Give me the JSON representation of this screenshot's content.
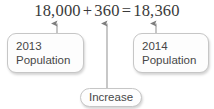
{
  "diagram": {
    "type": "labeled-equation-callout",
    "equation": {
      "left_term": "18,000",
      "plus_sign": "+",
      "middle_term": "360",
      "equals_sign": "=",
      "right_term": "18,360",
      "full_text": "18,000 + 360 = 18,360"
    },
    "callouts": [
      {
        "id": "left",
        "line1": "2013",
        "line2": "Population",
        "points_to": "left_term"
      },
      {
        "id": "middle",
        "line1": "Increase",
        "line2": "",
        "points_to": "middle_term"
      },
      {
        "id": "right",
        "line1": "2014",
        "line2": "Population",
        "points_to": "right_term"
      }
    ],
    "arrows": [
      {
        "id": "arrow-left",
        "name": "up-arrow-icon",
        "x": 57
      },
      {
        "id": "arrow-middle",
        "name": "up-arrow-icon",
        "x": 107
      },
      {
        "id": "arrow-right",
        "name": "up-arrow-icon",
        "x": 156
      }
    ],
    "colors": {
      "equation_text": "#3a3a3a",
      "callout_text": "#474747",
      "callout_border": "#c6c6c6",
      "callout_fill": "#fdfdfd",
      "connector_line": "#9a9a9a",
      "background": "#ffffff"
    }
  }
}
